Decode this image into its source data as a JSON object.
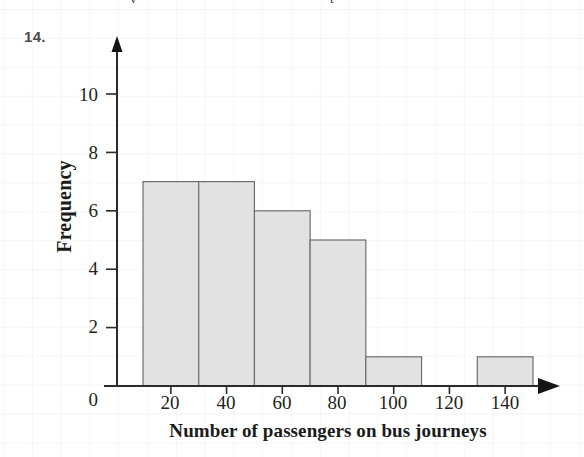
{
  "question": {
    "number": "14."
  },
  "top_clipped_text": {
    "fragment_left": "y",
    "fragment_right": "t"
  },
  "chart_data": {
    "type": "bar",
    "title": "",
    "xlabel": "Number of passengers on bus journeys",
    "ylabel": "Frequency",
    "xlim": [
      0,
      160
    ],
    "ylim": [
      0,
      11.5
    ],
    "xticks": [
      20,
      40,
      60,
      80,
      100,
      120,
      140
    ],
    "xtick_labels": [
      "20",
      "40",
      "60",
      "80",
      "100",
      "120",
      "140"
    ],
    "yticks": [
      0,
      2,
      4,
      6,
      8,
      10
    ],
    "ytick_labels": [
      "0",
      "2",
      "4",
      "6",
      "8",
      "10"
    ],
    "grid": true,
    "legend": null,
    "bar_fill_color": "#e2e2e2",
    "bar_edge_color": "#6f6f6f",
    "axis_color": "#2b2b2b",
    "bins": [
      {
        "start": 10,
        "end": 30,
        "frequency": 7
      },
      {
        "start": 30,
        "end": 50,
        "frequency": 7
      },
      {
        "start": 50,
        "end": 70,
        "frequency": 6
      },
      {
        "start": 70,
        "end": 90,
        "frequency": 5
      },
      {
        "start": 90,
        "end": 110,
        "frequency": 1
      },
      {
        "start": 130,
        "end": 150,
        "frequency": 1
      }
    ],
    "categories": [
      "10-30",
      "30-50",
      "50-70",
      "70-90",
      "90-110",
      "130-150"
    ],
    "values": [
      7,
      7,
      6,
      5,
      1,
      1
    ]
  }
}
